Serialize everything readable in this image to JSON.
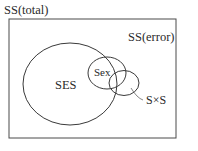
{
  "diagram": {
    "type": "venn",
    "title": "SS(total)",
    "regions": {
      "total": {
        "label": "SS(total)"
      },
      "error": {
        "label": "SS(error)"
      },
      "ses": {
        "label": "SES"
      },
      "sex": {
        "label": "Sex"
      },
      "interaction": {
        "label": "S×S"
      }
    },
    "colors": {
      "stroke": "#3a3a3a",
      "background": "#ffffff",
      "text": "#2a2a2a"
    }
  }
}
